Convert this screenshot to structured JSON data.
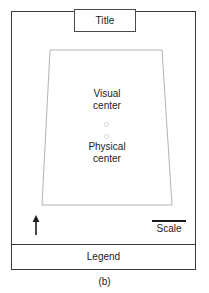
{
  "figure": {
    "caption": "(b)",
    "width": 209,
    "height": 293,
    "background_color": "#ffffff"
  },
  "map_layout": {
    "frame": {
      "name": "neat line",
      "stroke_color": "#3a3a3a",
      "x": 11,
      "y": 11,
      "width": 185,
      "height": 259
    },
    "title_box": {
      "label": "Title",
      "stroke_color": "#4a4a4a",
      "x": 74,
      "y": 9,
      "width": 62,
      "height": 23
    },
    "map_body": {
      "name": "map body",
      "shape": "trapezoid",
      "stroke_color": "#b4b4b4",
      "points": [
        {
          "x": 39,
          "y": 39
        },
        {
          "x": 151,
          "y": 39
        },
        {
          "x": 161,
          "y": 194
        },
        {
          "x": 31,
          "y": 194
        }
      ]
    },
    "visual_center": {
      "line1": "Visual",
      "line2": "center",
      "marker_color": "#d8d8d8"
    },
    "physical_center": {
      "line1": "Physical",
      "line2": "center",
      "marker_color": "#d8d8d8"
    },
    "north_arrow": {
      "label": "north arrow",
      "direction": "up",
      "color": "#1c1c1c"
    },
    "scale": {
      "label": "Scale",
      "bar_color": "#1c1c1c",
      "bar_length_px": 34
    },
    "legend_box": {
      "label": "Legend",
      "stroke_color": "#3a3a3a",
      "x": 11,
      "y": 244,
      "width": 185,
      "height": 26
    }
  }
}
